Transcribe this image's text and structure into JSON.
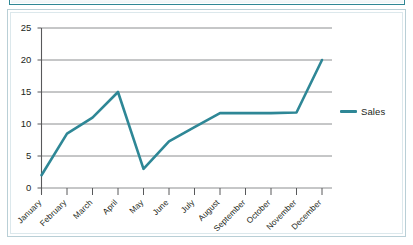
{
  "chart_data": {
    "type": "line",
    "title": "",
    "xlabel": "",
    "ylabel": "",
    "categories": [
      "January",
      "February",
      "March",
      "April",
      "May",
      "June",
      "July",
      "August",
      "September",
      "October",
      "November",
      "December"
    ],
    "series": [
      {
        "name": "Sales",
        "color": "#2e8796",
        "values": [
          2,
          8.5,
          11,
          15,
          3,
          7.3,
          9.5,
          11.7,
          11.7,
          11.7,
          11.8,
          20
        ]
      }
    ],
    "ylim": [
      0,
      25
    ],
    "yticks": [
      0,
      5,
      10,
      15,
      20,
      25
    ],
    "ytick_labels": [
      "0",
      "5",
      "10",
      "15",
      "20",
      "25"
    ],
    "grid": true,
    "grid_axis": "y",
    "legend_position": "right",
    "xtick_rotation": -45
  },
  "legend": {
    "entries": [
      {
        "label": "Sales"
      }
    ]
  },
  "colors": {
    "series_teal": "#2e8796",
    "gridline": "#808285",
    "axis": "#58595b",
    "frame": "#b9cfd6",
    "frame_inner": "#dce8ec",
    "text": "#231f20"
  }
}
